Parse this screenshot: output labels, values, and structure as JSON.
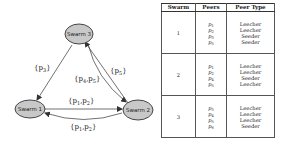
{
  "diagram": {
    "nodes": [
      {
        "id": "swarm3",
        "label": "Swarm 3",
        "fill": "#c8c8c8"
      },
      {
        "id": "swarm1",
        "label": "Swarm 1",
        "fill": "#c8c8c8"
      },
      {
        "id": "swarm2",
        "label": "Swarm 2",
        "fill": "#c8c8c8"
      }
    ],
    "edges": [
      {
        "from": "swarm3",
        "to": "swarm1",
        "label": "{p3}",
        "label_text": "{p",
        "label_sub": "3",
        "label_close": "}"
      },
      {
        "from": "swarm2",
        "to": "swarm3",
        "label": "{p5}",
        "label_text": "{p",
        "label_sub": "5",
        "label_close": "}"
      },
      {
        "from": "swarm3",
        "to": "swarm2",
        "label": "{p4,p5}",
        "label_text": "{p",
        "label_sub": "4",
        "label_mid": ",p",
        "label_sub2": "5",
        "label_close": "}"
      },
      {
        "from": "swarm1",
        "to": "swarm2",
        "label": "{p1,p2}",
        "label_text": "{p",
        "label_sub": "1",
        "label_mid": ",p",
        "label_sub2": "2",
        "label_close": "}"
      },
      {
        "from": "swarm2",
        "to": "swarm1",
        "label": "{p1,p2}",
        "label_text": "{p",
        "label_sub": "1",
        "label_mid": ",p",
        "label_sub2": "2",
        "label_close": "}"
      }
    ]
  },
  "table": {
    "headers": [
      "Swarm",
      "Peers",
      "Peer Type"
    ],
    "rows": [
      {
        "swarm": "1",
        "peers": [
          {
            "p": "p",
            "sub": "1"
          },
          {
            "p": "p",
            "sub": "2"
          },
          {
            "p": "p",
            "sub": "3"
          },
          {
            "p": "p",
            "sub": "5"
          }
        ],
        "types": [
          "Leecher",
          "Leecher",
          "Seeder",
          "Seeder"
        ]
      },
      {
        "swarm": "2",
        "peers": [
          {
            "p": "p",
            "sub": "1"
          },
          {
            "p": "p",
            "sub": "2"
          },
          {
            "p": "p",
            "sub": "4"
          },
          {
            "p": "p",
            "sub": "5"
          }
        ],
        "types": [
          "Leecher",
          "Leecher",
          "Seeder",
          "Leecher"
        ]
      },
      {
        "swarm": "3",
        "peers": [
          {
            "p": "p",
            "sub": "3"
          },
          {
            "p": "p",
            "sub": "4"
          },
          {
            "p": "p",
            "sub": "5"
          },
          {
            "p": "p",
            "sub": "6"
          }
        ],
        "types": [
          "Leecher",
          "Leecher",
          "Leecher",
          "Seeder"
        ]
      }
    ]
  }
}
